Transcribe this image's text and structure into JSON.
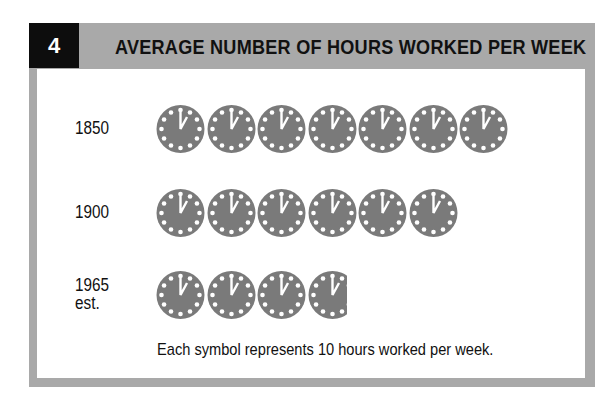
{
  "header": {
    "number": "4",
    "title": "AVERAGE NUMBER OF HOURS WORKED PER WEEK"
  },
  "rows": [
    {
      "label": "1850",
      "label2": "",
      "symbols": 7
    },
    {
      "label": "1900",
      "label2": "",
      "symbols": 6
    },
    {
      "label": "1965",
      "label2": "est.",
      "symbols": 3.8
    }
  ],
  "note": "Each symbol represents 10 hours worked per week.",
  "colors": {
    "frame": "#a9a9a9",
    "clock": "#7a7a7a",
    "numbox": "#0d0d0d"
  },
  "chart_data": {
    "type": "bar",
    "subtype": "pictograph",
    "title": "AVERAGE NUMBER OF HOURS WORKED PER WEEK",
    "figure_number": "4",
    "categories": [
      "1850",
      "1900",
      "1965 est."
    ],
    "values": [
      70,
      60,
      38
    ],
    "unit": "hours per week",
    "symbol": "clock",
    "symbol_value": 10,
    "symbol_counts": [
      7,
      6,
      3.8
    ],
    "legend": "Each symbol represents 10 hours worked per week.",
    "xlabel": "",
    "ylabel": ""
  }
}
